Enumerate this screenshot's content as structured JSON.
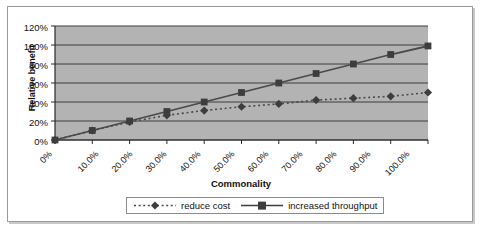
{
  "chart_data": {
    "type": "line",
    "title": "",
    "xlabel": "Commonality",
    "ylabel": "Relative benefit",
    "grid": true,
    "legend_position": "bottom",
    "x": [
      0,
      10,
      20,
      30,
      40,
      50,
      60,
      70,
      80,
      90,
      100
    ],
    "categories": [
      "0%",
      "10.0%",
      "20.0%",
      "30.0%",
      "40.0%",
      "50.0%",
      "60.0%",
      "70.0%",
      "80.0%",
      "90.0%",
      "100.0%"
    ],
    "ylim": [
      0,
      120
    ],
    "yticks": [
      0,
      20,
      40,
      60,
      80,
      100,
      120
    ],
    "ytick_labels": [
      "0%",
      "20%",
      "40%",
      "60%",
      "80%",
      "100%",
      "120%"
    ],
    "series": [
      {
        "name": "reduce cost",
        "marker": "diamond",
        "line_style": "dotted",
        "color": "#4a4a4a",
        "values": [
          0,
          10,
          19,
          26,
          31,
          35,
          38,
          42,
          44,
          46,
          50
        ]
      },
      {
        "name": "increased throughput",
        "marker": "square",
        "line_style": "solid",
        "color": "#4a4a4a",
        "values": [
          0,
          10,
          20,
          30,
          40,
          50,
          60,
          70,
          80,
          90,
          99
        ]
      }
    ]
  },
  "axes": {
    "y_title": "Relative benefit",
    "x_title": "Commonality"
  },
  "legend": {
    "items": [
      {
        "label": "reduce cost",
        "marker": "diamond-marker",
        "style": "dotted"
      },
      {
        "label": "increased throughput",
        "marker": "square-marker",
        "style": "solid"
      }
    ]
  },
  "colors": {
    "plot_background": "#b3b3b3",
    "gridline": "#3c3c3c",
    "axis": "#2a2a2a",
    "series": "#4a4a4a",
    "frame_border": "#9a9a9a"
  }
}
